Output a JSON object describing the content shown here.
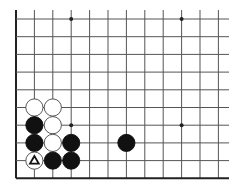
{
  "board": {
    "description": "Go board diagram, lower-left corner fragment",
    "colors": {
      "background": "#ffffff",
      "line": "#555555",
      "edge": "#222222",
      "black_stone": "#111111",
      "white_stone": "#ffffff",
      "marker": "#111111"
    },
    "grid": {
      "x_lines": [
        16,
        34.4,
        52.8,
        71.2,
        89.6,
        108,
        126.4,
        144.8,
        163.2,
        181.6,
        200,
        218.4
      ],
      "y_lines": [
        19,
        36.7,
        54.4,
        72.1,
        89.8,
        107.5,
        125.2,
        142.9,
        160.6,
        178.3
      ],
      "right_extent": 229,
      "top_extent": 10,
      "left_edge": true,
      "bottom_edge": true
    },
    "hoshi": [
      {
        "col": 3,
        "row": 0
      },
      {
        "col": 9,
        "row": 0
      },
      {
        "col": 3,
        "row": 6
      },
      {
        "col": 9,
        "row": 6
      }
    ],
    "stones": [
      {
        "color": "white",
        "col": 1,
        "row": 5
      },
      {
        "color": "white",
        "col": 2,
        "row": 5
      },
      {
        "color": "black",
        "col": 1,
        "row": 6
      },
      {
        "color": "white",
        "col": 2,
        "row": 6
      },
      {
        "color": "black",
        "col": 1,
        "row": 7
      },
      {
        "color": "white",
        "col": 2,
        "row": 7
      },
      {
        "color": "black",
        "col": 3,
        "row": 7
      },
      {
        "color": "black",
        "col": 6,
        "row": 7
      },
      {
        "color": "white",
        "col": 1,
        "row": 8,
        "marker": "triangle"
      },
      {
        "color": "black",
        "col": 2,
        "row": 8
      },
      {
        "color": "black",
        "col": 3,
        "row": 8
      }
    ]
  }
}
